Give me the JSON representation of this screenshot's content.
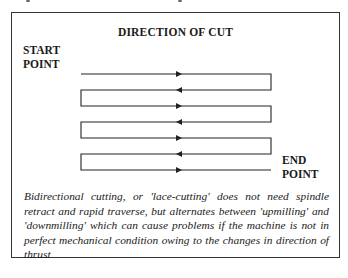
{
  "figure": {
    "title": "DIRECTION OF CUT",
    "start_label": [
      "START",
      "POINT"
    ],
    "end_label": [
      "END",
      "POINT"
    ],
    "passes": 7,
    "caption": "Bidirectional cutting, or 'lace-cutting' does not need spindle retract and rapid traverse, but alternates between 'upmilling' and 'downmilling' which can cause problems if the machine is not in perfect mechanical condition owing to the changes in direction of thrust",
    "partial_figure_caption": "Figure 4.11 Bidirectional cutting"
  }
}
